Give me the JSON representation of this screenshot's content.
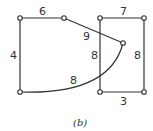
{
  "diagram": {
    "caption": "(b)",
    "edge_labels": {
      "top_left": "6",
      "left": "4",
      "diagonal": "9",
      "curve": "8",
      "rect_left": "8",
      "rect_top": "7",
      "rect_right": "8",
      "rect_bottom": "3"
    },
    "nodes": [
      {
        "id": "A",
        "x": 20,
        "y": 18
      },
      {
        "id": "B",
        "x": 64,
        "y": 18
      },
      {
        "id": "C",
        "x": 20,
        "y": 92
      },
      {
        "id": "D",
        "x": 100,
        "y": 18
      },
      {
        "id": "E",
        "x": 144,
        "y": 18
      },
      {
        "id": "F",
        "x": 100,
        "y": 92
      },
      {
        "id": "G",
        "x": 144,
        "y": 92
      },
      {
        "id": "H",
        "x": 123,
        "y": 43
      }
    ],
    "edges": [
      {
        "from": "A",
        "to": "B",
        "weight": "6"
      },
      {
        "from": "A",
        "to": "C",
        "weight": "4"
      },
      {
        "from": "B",
        "to": "H",
        "weight": "9"
      },
      {
        "from": "C",
        "to": "H",
        "weight": "8",
        "shape": "curve"
      },
      {
        "from": "D",
        "to": "E",
        "weight": "7"
      },
      {
        "from": "D",
        "to": "F",
        "weight": "8"
      },
      {
        "from": "E",
        "to": "G",
        "weight": "8"
      },
      {
        "from": "F",
        "to": "G",
        "weight": "3"
      }
    ]
  }
}
